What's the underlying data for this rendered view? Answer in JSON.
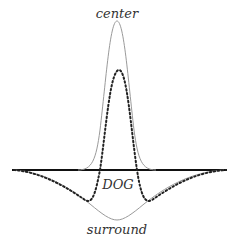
{
  "labels": {
    "center": "center",
    "dog": "DOG",
    "surround": "surround"
  },
  "colors": {
    "baseline": "#111111",
    "center_curve": "#9a9a9a",
    "surround_curve": "#9a9a9a",
    "dog_curve": "#222222",
    "text": "#333333"
  }
}
